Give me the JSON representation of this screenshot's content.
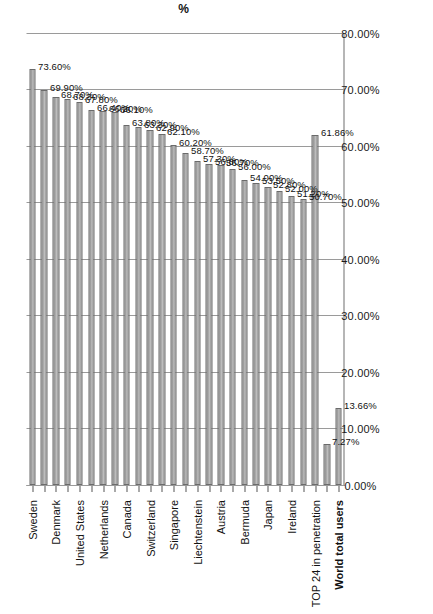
{
  "chart_data": {
    "type": "bar",
    "title": "",
    "subtitle": "",
    "orientation": "vertical-rotated-90ccw",
    "xlabel": "",
    "ylabel": "%",
    "ylim": [
      0,
      80
    ],
    "ytick_labels": [
      "0.00%",
      "10.00%",
      "20.00%",
      "30.00%",
      "40.00%",
      "50.00%",
      "60.00%",
      "70.00%",
      "80.00%"
    ],
    "ytick_values": [
      0,
      10,
      20,
      30,
      40,
      50,
      60,
      70,
      80
    ],
    "grid": true,
    "legend": "none",
    "bar_color": "#9e9e9e",
    "bar_edge_color": "#6b6b6b",
    "categories": [
      "World total users",
      "",
      "TOP 24 in penetration",
      "",
      "Ireland",
      "",
      "Japan",
      "",
      "Bermuda",
      "",
      "Austria",
      "",
      "Liechtenstein",
      "",
      "Singapore",
      "",
      "Switzerland",
      "",
      "Canada",
      "",
      "Netherlands",
      "",
      "United States",
      "",
      "Denmark",
      "",
      "Sweden"
    ],
    "values": [
      13.66,
      7.27,
      61.86,
      50.7,
      51.2,
      52.0,
      52.8,
      53.5,
      54.0,
      56.0,
      56.7,
      56.8,
      57.3,
      58.7,
      60.2,
      62.1,
      62.9,
      63.3,
      63.8,
      66.1,
      66.2,
      66.4,
      67.8,
      68.3,
      68.7,
      69.9,
      73.6
    ],
    "data_labels": [
      "13.66%",
      "7.27%",
      "61.86%",
      "50.70%",
      "51.20%",
      "52.00%",
      "52.80%",
      "53.50%",
      "54.00%",
      "56.00%",
      "56.70%",
      "56.80%",
      "57.30%",
      "58.70%",
      "60.20%",
      "62.10%",
      "62.90%",
      "63.30%",
      "63.80%",
      "66.10%",
      "66.20%",
      "66.40%",
      "67.80%",
      "68.30%",
      "68.70%",
      "69.90%",
      "73.60%"
    ],
    "bold_categories": [
      "World total users"
    ]
  }
}
